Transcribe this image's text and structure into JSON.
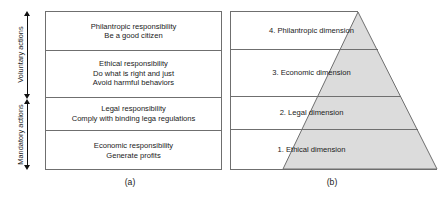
{
  "figure": {
    "panel_a": {
      "caption": "(a)",
      "brackets": [
        {
          "label": "Voluntary actions"
        },
        {
          "label": "Mandatory actions"
        }
      ],
      "rows": [
        {
          "lines": [
            "Philantropic responsibility",
            "Be a good citizen"
          ]
        },
        {
          "lines": [
            "Ethical responsibility",
            "Do what is right and just",
            "Avoid harmful behaviors"
          ]
        },
        {
          "lines": [
            "Legal responsibility",
            "Comply with binding lega regulations"
          ]
        },
        {
          "lines": [
            "Economic responsibility",
            "Generate profits"
          ]
        }
      ]
    },
    "panel_b": {
      "caption": "(b)",
      "rows": [
        {
          "label": "4. Philantropic dimension"
        },
        {
          "label": "3. Economic dimension"
        },
        {
          "label": "2. Legal dimension"
        },
        {
          "label": "1. Ethical dimension"
        }
      ]
    },
    "colors": {
      "line": "#6f6f6f",
      "text": "#1a1a1a",
      "pyramid_fill": "#dcdcdc",
      "pyramid_stroke": "#6f6f6f",
      "arrow": "#111111",
      "background": "#ffffff"
    }
  }
}
